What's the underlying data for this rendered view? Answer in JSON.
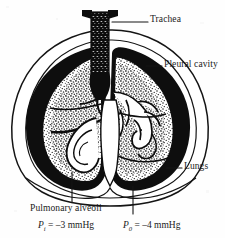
{
  "figure": {
    "type": "anatomical-diagram",
    "background_color": "#fefefe",
    "ink_color": "#111111"
  },
  "labels": {
    "trachea": "Trachea",
    "pleural_cavity": "Pleural cavity",
    "lungs": "Lungs",
    "pulmonary_alveoli": "Pulmonary alveoli"
  },
  "equations": {
    "intrapulmonary": {
      "symbol": "P",
      "subscript": "i",
      "relation": "=",
      "value": "–3 mmHg",
      "full": "Pi = –3 mmHg"
    },
    "intrapleural": {
      "symbol": "P",
      "subscript": "0",
      "relation": "=",
      "value": "–4 mmHg",
      "full": "P0 = –4 mmHg"
    }
  },
  "parts": [
    "chest-wall",
    "pleural-cavity",
    "left-lung",
    "right-lung",
    "trachea",
    "bronchial-tree",
    "diaphragm"
  ]
}
